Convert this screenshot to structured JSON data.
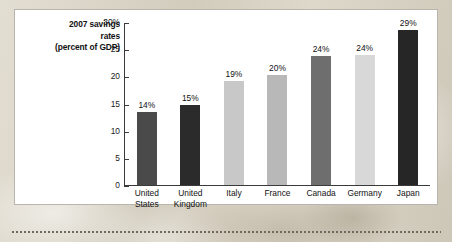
{
  "chart_data": {
    "type": "bar",
    "title": "2007 savings rates (percent of GDP)",
    "title_lines": [
      "2007 savings",
      "rates",
      "(percent of GDP)"
    ],
    "xlabel": "",
    "ylabel": "percent of GDP",
    "ylim": [
      0,
      30
    ],
    "grid": false,
    "legend": "none",
    "y_ticks": [
      {
        "value": 30,
        "label": "30%"
      },
      {
        "value": 25,
        "label": "25"
      },
      {
        "value": 20,
        "label": "20"
      },
      {
        "value": 15,
        "label": "15"
      },
      {
        "value": 10,
        "label": "10"
      },
      {
        "value": 5,
        "label": "5"
      },
      {
        "value": 0,
        "label": "0"
      }
    ],
    "categories": [
      "United States",
      "United Kingdom",
      "Italy",
      "France",
      "Canada",
      "Germany",
      "Japan"
    ],
    "category_lines": [
      [
        "United",
        "States"
      ],
      [
        "United",
        "Kingdom"
      ],
      [
        "Italy"
      ],
      [
        "France"
      ],
      [
        "Canada"
      ],
      [
        "Germany"
      ],
      [
        "Japan"
      ]
    ],
    "values": [
      14,
      15,
      19,
      20,
      24,
      24,
      29
    ],
    "plotted_values": [
      13.6,
      14.9,
      19.2,
      20.3,
      23.8,
      24.0,
      28.7
    ],
    "data_labels": [
      "14%",
      "15%",
      "19%",
      "20%",
      "24%",
      "24%",
      "29%"
    ],
    "bar_colors": [
      "#4a4a4a",
      "#2b2b2b",
      "#c8c8c8",
      "#b8b8b8",
      "#6e6e6e",
      "#d8d8d8",
      "#262626"
    ]
  },
  "colors": {
    "page_background": "#d8d3c6",
    "card_background": "#ffffff",
    "card_border": "#b9b5ac",
    "axis": "#3a3a3a",
    "text": "#111111",
    "dotted_rule": "#6f6a60"
  }
}
